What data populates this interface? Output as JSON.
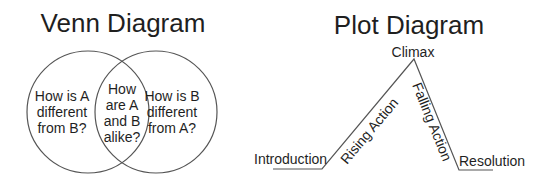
{
  "venn": {
    "title": "Venn Diagram",
    "left": [
      "How is A",
      "different",
      "from B?"
    ],
    "middle": [
      "How",
      "are A",
      "and B",
      "alike?"
    ],
    "right": [
      "How is B",
      "different",
      "from A?"
    ]
  },
  "plot": {
    "title": "Plot Diagram",
    "climax": "Climax",
    "introduction": "Introduction",
    "rising_action": "Rising Action",
    "falling_action": "Falling Action",
    "resolution": "Resolution"
  },
  "colors": {
    "line": "#555555",
    "text": "#1f1f1f",
    "background": "#ffffff"
  }
}
